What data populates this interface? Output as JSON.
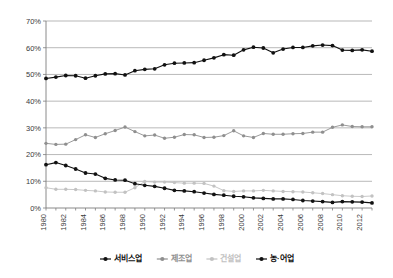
{
  "chart_data": {
    "type": "line",
    "title": "",
    "xlabel": "",
    "ylabel": "",
    "ylim": [
      0,
      70
    ],
    "ytick_labels": [
      "0%",
      "10%",
      "20%",
      "30%",
      "40%",
      "50%",
      "60%",
      "70%"
    ],
    "ytick_values": [
      0,
      10,
      20,
      30,
      40,
      50,
      60,
      70
    ],
    "grid": true,
    "legend_position": "bottom",
    "x": [
      1980,
      1981,
      1982,
      1983,
      1984,
      1985,
      1986,
      1987,
      1988,
      1989,
      1990,
      1991,
      1992,
      1993,
      1994,
      1995,
      1996,
      1997,
      1998,
      1999,
      2000,
      2001,
      2002,
      2003,
      2004,
      2005,
      2006,
      2007,
      2008,
      2009,
      2010,
      2011,
      2012,
      2013
    ],
    "xtick_labels": [
      "1980",
      "1982",
      "1984",
      "1986",
      "1988",
      "1990",
      "1992",
      "1994",
      "1996",
      "1998",
      "2000",
      "2002",
      "2004",
      "2006",
      "2008",
      "2010",
      "2012"
    ],
    "xtick_values": [
      1980,
      1982,
      1984,
      1986,
      1988,
      1990,
      1992,
      1994,
      1996,
      1998,
      2000,
      2002,
      2004,
      2006,
      2008,
      2010,
      2012
    ],
    "series": [
      {
        "name": "서비스업",
        "color": "#111111",
        "marker": "circle",
        "values": [
          48.5,
          49.0,
          49.6,
          49.5,
          48.6,
          49.5,
          50.2,
          50.3,
          49.8,
          51.4,
          51.9,
          52.1,
          53.6,
          54.2,
          54.3,
          54.4,
          55.3,
          56.2,
          57.4,
          57.2,
          59.2,
          60.2,
          59.9,
          58.1,
          59.5,
          60.1,
          60.1,
          60.7,
          61.0,
          60.8,
          59.1,
          59.0,
          59.2,
          58.7
        ]
      },
      {
        "name": "제조업",
        "color": "#8f8f8f",
        "marker": "circle",
        "values": [
          24.2,
          23.8,
          23.9,
          25.6,
          27.4,
          26.4,
          27.8,
          29.0,
          30.3,
          28.6,
          27.0,
          27.3,
          26.1,
          26.5,
          27.5,
          27.4,
          26.4,
          26.5,
          27.1,
          28.9,
          27.0,
          26.4,
          27.9,
          27.6,
          27.6,
          27.8,
          27.9,
          28.4,
          28.4,
          30.2,
          31.1,
          30.5,
          30.4,
          30.4
        ]
      },
      {
        "name": "건설업",
        "color": "#c2c2c2",
        "marker": "circle",
        "values": [
          7.6,
          7.0,
          7.0,
          6.9,
          6.6,
          6.4,
          6.0,
          5.9,
          5.9,
          7.6,
          9.9,
          9.7,
          9.7,
          9.5,
          9.3,
          9.3,
          9.2,
          8.2,
          6.5,
          6.2,
          6.4,
          6.4,
          6.6,
          6.4,
          6.2,
          6.1,
          6.0,
          5.7,
          5.4,
          5.0,
          4.6,
          4.4,
          4.3,
          4.5
        ]
      },
      {
        "name": "농·어업",
        "color": "#111111",
        "marker": "circle",
        "values": [
          16.2,
          17.0,
          15.9,
          14.6,
          13.1,
          12.7,
          11.1,
          10.5,
          10.4,
          9.1,
          8.5,
          8.1,
          7.4,
          6.6,
          6.4,
          6.1,
          5.6,
          5.1,
          4.8,
          4.4,
          4.2,
          3.8,
          3.6,
          3.4,
          3.4,
          3.2,
          2.8,
          2.6,
          2.4,
          2.1,
          2.4,
          2.3,
          2.2,
          1.9
        ]
      }
    ],
    "legend": [
      {
        "label": "서비스업",
        "color": "#111111"
      },
      {
        "label": "제조업",
        "color": "#8f8f8f"
      },
      {
        "label": "건설업",
        "color": "#c2c2c2"
      },
      {
        "label": "농·어업",
        "color": "#111111"
      }
    ]
  }
}
